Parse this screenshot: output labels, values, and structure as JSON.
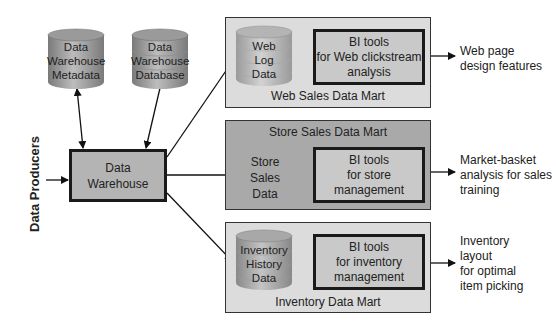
{
  "colors": {
    "background": "#ffffff",
    "web_mart_bg": "#dcdcdc",
    "store_mart_bg": "#a9a9a9",
    "inventory_mart_bg": "#dcdcdc",
    "bi_box_bg": "#c9c9c9",
    "warehouse_bg": "#b4b4b4",
    "cylinder_dark": "#8a8a8a",
    "cylinder_light": "#c8c8c8"
  },
  "left": {
    "producers_label": "Data Producers",
    "warehouse": {
      "line1": "Data",
      "line2": "Warehouse"
    },
    "metadata_db": {
      "line1": "Data",
      "line2": "Warehouse",
      "line3": "Metadata"
    },
    "warehouse_db": {
      "line1": "Data",
      "line2": "Warehouse",
      "line3": "Database"
    }
  },
  "marts": [
    {
      "title": "Web Sales Data Mart",
      "data_store": {
        "line1": "Web",
        "line2": "Log",
        "line3": "Data"
      },
      "bi_tool": {
        "line1": "BI tools",
        "line2": "for Web clickstream",
        "line3": "analysis"
      },
      "output": {
        "line1": "Web page",
        "line2": "design features"
      }
    },
    {
      "title": "Store Sales Data Mart",
      "data_store": {
        "line1": "Store",
        "line2": "Sales",
        "line3": "Data"
      },
      "bi_tool": {
        "line1": "BI tools",
        "line2": "for store",
        "line3": "management"
      },
      "output": {
        "line1": "Market-basket",
        "line2": "analysis for sales",
        "line3": "training"
      }
    },
    {
      "title": "Inventory Data Mart",
      "data_store": {
        "line1": "Inventory",
        "line2": "History",
        "line3": "Data"
      },
      "bi_tool": {
        "line1": "BI tools",
        "line2": "for inventory",
        "line3": "management"
      },
      "output": {
        "line1": "Inventory",
        "line2": "layout",
        "line3": "for optimal",
        "line4": "item picking"
      }
    }
  ]
}
